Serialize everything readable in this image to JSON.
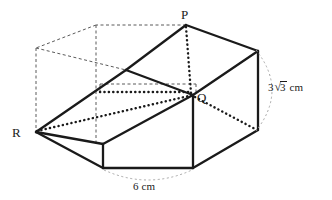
{
  "figure": {
    "kind": "3d-prism-diagram",
    "stroke_color": "#1a1a1a",
    "hidden_edge_color": "#555555",
    "arc_color": "#9a9a9a",
    "background": "#ffffff",
    "vertices": [
      {
        "name": "P",
        "label": "P",
        "x": 186,
        "y": 25,
        "label_x": 181,
        "label_y": 8
      },
      {
        "name": "Q",
        "label": "Q",
        "x": 193,
        "y": 95,
        "label_x": 197,
        "label_y": 91
      },
      {
        "name": "R",
        "label": "R",
        "x": 36,
        "y": 132,
        "label_x": 12,
        "label_y": 126
      }
    ],
    "dimensions": [
      {
        "name": "height",
        "coefficient": "3",
        "radical_sign": "√",
        "radicand": "3",
        "unit": "cm",
        "text": "3√3 cm",
        "label_x": 268,
        "label_y": 81
      },
      {
        "name": "width",
        "coefficient": "6",
        "radical_sign": "",
        "radicand": "",
        "unit": "cm",
        "text": "6 cm",
        "label_x": 133,
        "label_y": 181
      }
    ]
  }
}
